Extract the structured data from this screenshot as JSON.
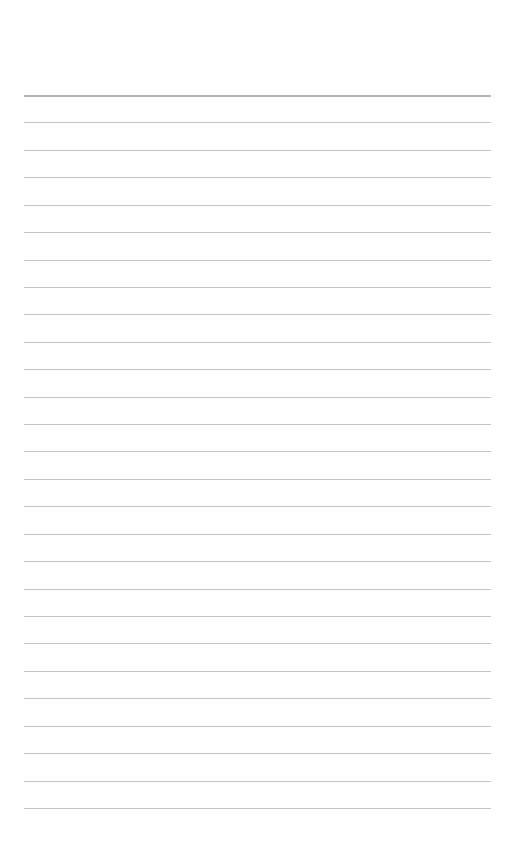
{
  "paper": {
    "type": "lined-notepaper",
    "line_count": 27,
    "first_line_y": 95,
    "line_spacing": 27.42,
    "line_left": 24,
    "line_width": 467,
    "line_color": "#c4c4c4",
    "background_color": "#fefefe"
  }
}
